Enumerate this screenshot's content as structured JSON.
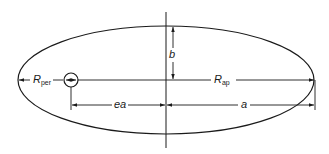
{
  "diagram": {
    "type": "elliptical-orbit",
    "colors": {
      "line": "#1a1a1a",
      "background": "#ffffff"
    },
    "labels": {
      "r_per": {
        "main": "R",
        "sub": "per"
      },
      "r_ap": {
        "main": "R",
        "sub": "ap"
      },
      "semi_minor": "b",
      "focal_offset": "ea",
      "semi_major": "a"
    },
    "geometry": {
      "ellipse": {
        "cx": 166,
        "cy": 80,
        "rx": 148,
        "ry": 54
      },
      "focus": {
        "cx": 71,
        "cy": 80,
        "r": 7
      },
      "minor_axis_line": {
        "x": 166,
        "y1": 12,
        "y2": 148
      },
      "dimension_row_y": 105
    }
  }
}
